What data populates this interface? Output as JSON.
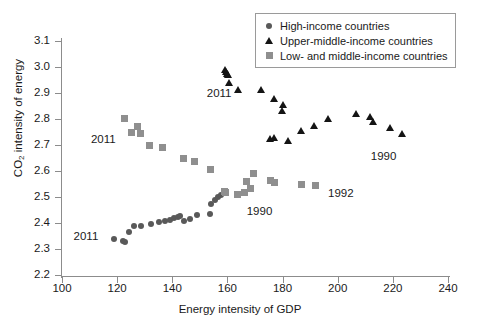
{
  "chart_data": {
    "type": "scatter",
    "title": "",
    "xlabel": "Energy intensity of GDP",
    "ylabel": "CO2 intensity of energy",
    "ylabel_html": "CO<sub>2</sub> intensity of energy",
    "xlim": [
      100,
      240
    ],
    "ylim": [
      2.2,
      3.1
    ],
    "xticks": [
      100,
      120,
      140,
      160,
      180,
      200,
      220,
      240
    ],
    "yticks": [
      "2.2",
      "2.3",
      "2.4",
      "2.5",
      "2.6",
      "2.7",
      "2.8",
      "2.9",
      "3.0",
      "3.1"
    ],
    "grid": false,
    "legend_position": "top-right",
    "series": [
      {
        "name": "High-income countries",
        "marker": "circle",
        "color": "#595959",
        "points": [
          [
            118.8,
            2.339
          ],
          [
            122.3,
            2.332
          ],
          [
            122.9,
            2.327
          ],
          [
            124.2,
            2.366
          ],
          [
            126.1,
            2.39
          ],
          [
            128.6,
            2.389
          ],
          [
            132.1,
            2.396
          ],
          [
            135.0,
            2.405
          ],
          [
            137.3,
            2.409
          ],
          [
            139.1,
            2.411
          ],
          [
            140.8,
            2.419
          ],
          [
            142.0,
            2.424
          ],
          [
            142.9,
            2.428
          ],
          [
            144.3,
            2.406
          ],
          [
            146.4,
            2.415
          ],
          [
            148.8,
            2.43
          ],
          [
            153.6,
            2.436
          ],
          [
            154.2,
            2.473
          ],
          [
            155.6,
            2.49
          ],
          [
            156.6,
            2.499
          ],
          [
            157.8,
            2.506
          ],
          [
            159.0,
            2.517
          ],
          [
            159.6,
            2.521
          ]
        ]
      },
      {
        "name": "Upper-middle-income countries",
        "marker": "triangle",
        "color": "#141414",
        "points": [
          [
            159.3,
            2.99
          ],
          [
            159.6,
            2.982
          ],
          [
            159.9,
            2.975
          ],
          [
            160.2,
            2.968
          ],
          [
            160.6,
            2.94
          ],
          [
            163.9,
            2.91
          ],
          [
            172.2,
            2.912
          ],
          [
            175.5,
            2.722
          ],
          [
            177.0,
            2.726
          ],
          [
            176.8,
            2.878
          ],
          [
            180.0,
            2.854
          ],
          [
            179.8,
            2.83
          ],
          [
            181.9,
            2.717
          ],
          [
            186.6,
            2.752
          ],
          [
            191.4,
            2.774
          ],
          [
            196.5,
            2.8
          ],
          [
            206.5,
            2.82
          ],
          [
            211.8,
            2.808
          ],
          [
            212.8,
            2.79
          ],
          [
            218.8,
            2.764
          ],
          [
            223.3,
            2.744
          ]
        ]
      },
      {
        "name": "Low- and middle-income countries",
        "marker": "square",
        "color": "#8f8f8f",
        "points": [
          [
            122.8,
            2.802
          ],
          [
            125.3,
            2.748
          ],
          [
            127.3,
            2.773
          ],
          [
            128.5,
            2.744
          ],
          [
            131.8,
            2.7
          ],
          [
            136.6,
            2.69
          ],
          [
            144.0,
            2.65
          ],
          [
            148.0,
            2.635
          ],
          [
            154.0,
            2.607
          ],
          [
            158.8,
            2.522
          ],
          [
            159.4,
            2.518
          ],
          [
            163.6,
            2.51
          ],
          [
            166.3,
            2.519
          ],
          [
            167.0,
            2.559
          ],
          [
            168.2,
            2.533
          ],
          [
            169.6,
            2.592
          ],
          [
            175.8,
            2.563
          ],
          [
            177.2,
            2.556
          ],
          [
            186.8,
            2.547
          ],
          [
            192.0,
            2.543
          ]
        ]
      }
    ],
    "annotations": [
      {
        "text": "2011",
        "x": 104.2,
        "y": 2.345,
        "for": "high-income-start"
      },
      {
        "text": "2011",
        "x": 110.5,
        "y": 2.72,
        "for": "low-middle-income-start"
      },
      {
        "text": "2011",
        "x": 152.5,
        "y": 2.898,
        "for": "upper-middle-income-start"
      },
      {
        "text": "1990",
        "x": 167.0,
        "y": 2.442,
        "for": "high-income-end"
      },
      {
        "text": "1992",
        "x": 196.5,
        "y": 2.51,
        "for": "low-middle-income-end"
      },
      {
        "text": "1990",
        "x": 212.0,
        "y": 2.655,
        "for": "upper-middle-income-end"
      }
    ]
  },
  "legend": {
    "items": [
      {
        "label": "High-income countries",
        "marker": "circle-marker-icon"
      },
      {
        "label": "Upper-middle-income countries",
        "marker": "triangle-marker-icon"
      },
      {
        "label": "Low- and middle-income countries",
        "marker": "square-marker-icon"
      }
    ]
  }
}
